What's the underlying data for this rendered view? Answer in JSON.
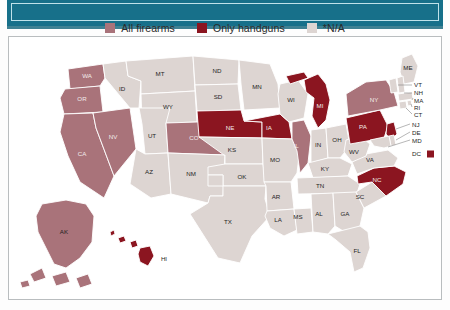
{
  "header": {
    "band_color": "#17708a",
    "band_inner_border_color": "#bfe2ea"
  },
  "legend": {
    "items": [
      {
        "label": "All firearms",
        "color": "#a9737a",
        "swatch_name": "legend-swatch-all-firearms"
      },
      {
        "label": "Only handguns",
        "color": "#8b1520",
        "swatch_name": "legend-swatch-only-handguns"
      },
      {
        "label": "*N/A",
        "color": "#ddd5d2",
        "swatch_name": "legend-swatch-na"
      }
    ]
  },
  "map": {
    "type": "choropleth",
    "region": "United States",
    "categories": {
      "all_firearms": "All firearms",
      "only_handguns": "Only handguns",
      "na": "*N/A"
    },
    "colors": {
      "all_firearms": "#a9737a",
      "only_handguns": "#8b1520",
      "na": "#ddd5d2",
      "border": "#ffffff"
    },
    "states": [
      {
        "code": "WA",
        "category": "all_firearms"
      },
      {
        "code": "OR",
        "category": "all_firearms"
      },
      {
        "code": "CA",
        "category": "all_firearms"
      },
      {
        "code": "NV",
        "category": "all_firearms"
      },
      {
        "code": "CO",
        "category": "all_firearms"
      },
      {
        "code": "IL",
        "category": "all_firearms"
      },
      {
        "code": "NY",
        "category": "all_firearms"
      },
      {
        "code": "AK",
        "category": "all_firearms"
      },
      {
        "code": "NE",
        "category": "only_handguns"
      },
      {
        "code": "IA",
        "category": "only_handguns"
      },
      {
        "code": "MI",
        "category": "only_handguns"
      },
      {
        "code": "PA",
        "category": "only_handguns"
      },
      {
        "code": "NC",
        "category": "only_handguns"
      },
      {
        "code": "NJ",
        "category": "only_handguns"
      },
      {
        "code": "HI",
        "category": "only_handguns"
      },
      {
        "code": "DC",
        "category": "only_handguns"
      },
      {
        "code": "ID",
        "category": "na"
      },
      {
        "code": "MT",
        "category": "na"
      },
      {
        "code": "WY",
        "category": "na"
      },
      {
        "code": "UT",
        "category": "na"
      },
      {
        "code": "AZ",
        "category": "na"
      },
      {
        "code": "NM",
        "category": "na"
      },
      {
        "code": "ND",
        "category": "na"
      },
      {
        "code": "SD",
        "category": "na"
      },
      {
        "code": "MN",
        "category": "na"
      },
      {
        "code": "WI",
        "category": "na"
      },
      {
        "code": "KS",
        "category": "na"
      },
      {
        "code": "MO",
        "category": "na"
      },
      {
        "code": "OK",
        "category": "na"
      },
      {
        "code": "TX",
        "category": "na"
      },
      {
        "code": "AR",
        "category": "na"
      },
      {
        "code": "LA",
        "category": "na"
      },
      {
        "code": "MS",
        "category": "na"
      },
      {
        "code": "AL",
        "category": "na"
      },
      {
        "code": "GA",
        "category": "na"
      },
      {
        "code": "FL",
        "category": "na"
      },
      {
        "code": "SC",
        "category": "na"
      },
      {
        "code": "TN",
        "category": "na"
      },
      {
        "code": "KY",
        "category": "na"
      },
      {
        "code": "IN",
        "category": "na"
      },
      {
        "code": "OH",
        "category": "na"
      },
      {
        "code": "WV",
        "category": "na"
      },
      {
        "code": "VA",
        "category": "na"
      },
      {
        "code": "ME",
        "category": "na"
      },
      {
        "code": "VT",
        "category": "na"
      },
      {
        "code": "NH",
        "category": "na"
      },
      {
        "code": "MA",
        "category": "na"
      },
      {
        "code": "RI",
        "category": "na"
      },
      {
        "code": "CT",
        "category": "na"
      },
      {
        "code": "DE",
        "category": "na"
      },
      {
        "code": "MD",
        "category": "na"
      }
    ],
    "labels": {
      "WA": "WA",
      "OR": "OR",
      "CA": "CA",
      "NV": "NV",
      "ID": "ID",
      "MT": "MT",
      "WY": "WY",
      "UT": "UT",
      "CO": "CO",
      "AZ": "AZ",
      "NM": "NM",
      "ND": "ND",
      "SD": "SD",
      "NE": "NE",
      "KS": "KS",
      "OK": "OK",
      "TX": "TX",
      "MN": "MN",
      "IA": "IA",
      "MO": "MO",
      "AR": "AR",
      "LA": "LA",
      "WI": "WI",
      "IL": "IL",
      "MS": "MS",
      "MI": "MI",
      "IN": "IN",
      "KY": "KY",
      "TN": "TN",
      "AL": "AL",
      "GA": "GA",
      "FL": "FL",
      "SC": "SC",
      "NC": "NC",
      "OH": "OH",
      "WV": "WV",
      "VA": "VA",
      "PA": "PA",
      "NY": "NY",
      "ME": "ME",
      "AK": "AK",
      "HI": "HI"
    },
    "callouts": [
      {
        "code": "VT",
        "label": "VT"
      },
      {
        "code": "NH",
        "label": "NH"
      },
      {
        "code": "MA",
        "label": "MA"
      },
      {
        "code": "RI",
        "label": "RI"
      },
      {
        "code": "CT",
        "label": "CT"
      },
      {
        "code": "NJ",
        "label": "NJ"
      },
      {
        "code": "DE",
        "label": "DE"
      },
      {
        "code": "MD",
        "label": "MD"
      },
      {
        "code": "DC",
        "label": "DC"
      }
    ]
  }
}
